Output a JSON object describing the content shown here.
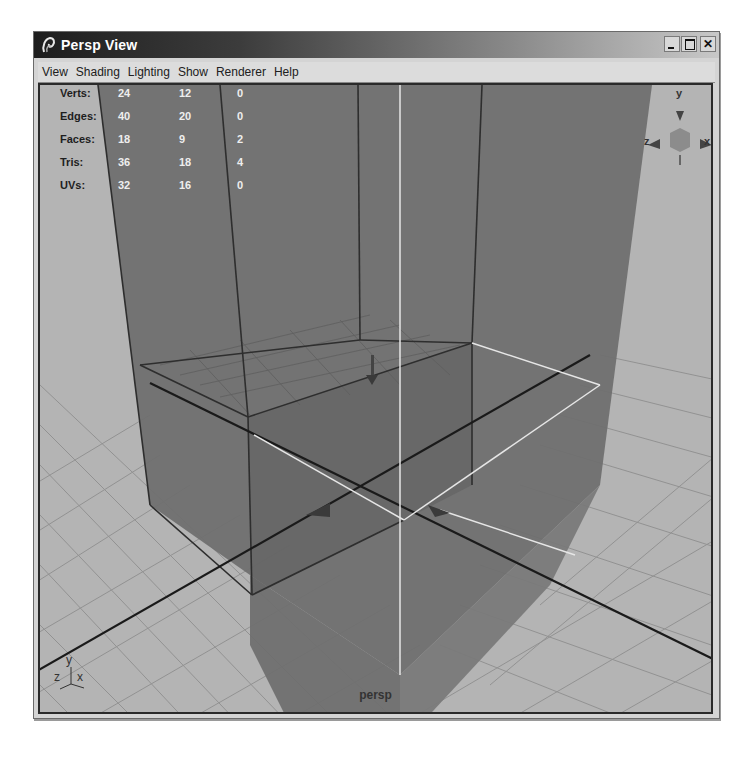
{
  "window": {
    "title": "Persp View",
    "controls": {
      "minimize": "_",
      "maximize": "□",
      "close": "✕"
    }
  },
  "menubar": {
    "items": [
      "View",
      "Shading",
      "Lighting",
      "Show",
      "Renderer",
      "Help"
    ]
  },
  "hud": {
    "rows": [
      {
        "label": "Verts:",
        "values": [
          "24",
          "12",
          "0"
        ]
      },
      {
        "label": "Edges:",
        "values": [
          "40",
          "20",
          "0"
        ]
      },
      {
        "label": "Faces:",
        "values": [
          "18",
          "9",
          "2"
        ]
      },
      {
        "label": "Tris:",
        "values": [
          "36",
          "18",
          "4"
        ]
      },
      {
        "label": "UVs:",
        "values": [
          "32",
          "16",
          "0"
        ]
      }
    ]
  },
  "view_cube": {
    "axis_y": "y",
    "axis_z": "z",
    "axis_x": "x"
  },
  "axis_indicator": {
    "y": "y",
    "z": "z",
    "x": "x"
  },
  "camera": {
    "name": "persp"
  },
  "colors": {
    "titlebar_dark": "#1e1e1e",
    "viewport_bg": "#b4b4b4",
    "object_fill": "#6e6e6e",
    "grid_line": "#8c8c8c",
    "highlight_edge": "#e8e8e8"
  }
}
